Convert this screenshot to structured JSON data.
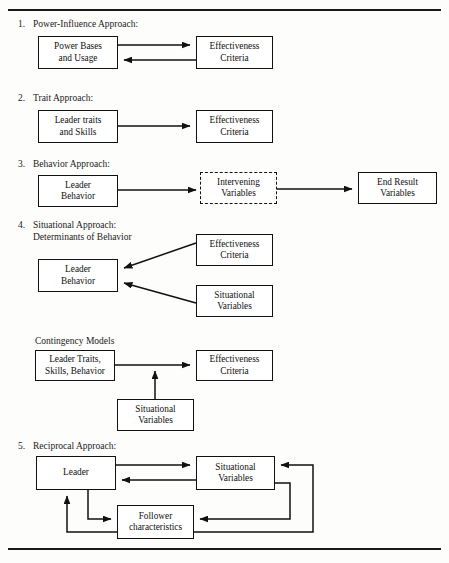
{
  "page": {
    "has_top_rule": true,
    "has_bottom_rule": true,
    "ink_color": "#111111",
    "background_color": "#fdfdfc"
  },
  "sections": [
    {
      "number": "1.",
      "label": "Power-Influence Approach:",
      "nodes": {
        "left": "Power Bases\nand Usage",
        "right": "Effectiveness\nCriteria"
      }
    },
    {
      "number": "2.",
      "label": "Trait Approach:",
      "nodes": {
        "left": "Leader traits\nand Skills",
        "right": "Effectiveness\nCriteria"
      }
    },
    {
      "number": "3.",
      "label": "Behavior Approach:",
      "nodes": {
        "left": "Leader\nBehavior",
        "middle": "Intervening\nVariables",
        "right": "End Result\nVariables"
      }
    },
    {
      "number": "4.",
      "label": "Situational Approach:\nDeterminants of Behavior",
      "sublabel": "Contingency Models",
      "nodes": {
        "leader_behavior": "Leader\nBehavior",
        "effectiveness": "Effectiveness\nCriteria",
        "situational": "Situational\nVariables",
        "leader_traits": "Leader Traits,\nSkills, Behavior",
        "effectiveness2": "Effectiveness\nCriteria",
        "situational2": "Situational\nVariables"
      }
    },
    {
      "number": "5.",
      "label": "Reciprocal Approach:",
      "nodes": {
        "leader": "Leader",
        "situational": "Situational\nVariables",
        "follower": "Follower\ncharacteristics"
      }
    }
  ]
}
